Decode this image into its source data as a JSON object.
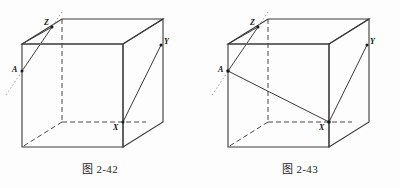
{
  "document": {
    "page_background": "#fdfdfd",
    "ink_color": "#3a3a3a",
    "label_color": "#111111"
  },
  "figures": [
    {
      "id": "fig-2-42",
      "caption": "图 2-42",
      "vertex_labels": {
        "A": "A",
        "X": "X",
        "Y": "Y",
        "Z": "Z"
      },
      "description_elements": [
        "cube-wireframe",
        "hidden-edges-dashed",
        "line-Z-to-A",
        "line-X-to-Y",
        "dotted-extension-through-A-and-Z"
      ]
    },
    {
      "id": "fig-2-43",
      "caption": "图 2-43",
      "vertex_labels": {
        "A": "A",
        "X": "X",
        "Y": "Y",
        "Z": "Z"
      },
      "description_elements": [
        "cube-wireframe",
        "hidden-edges-dashed",
        "line-Z-to-A",
        "line-A-to-X",
        "line-X-to-Y",
        "dotted-extension-through-A-and-Z"
      ]
    }
  ]
}
